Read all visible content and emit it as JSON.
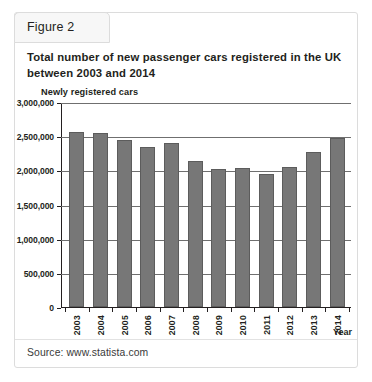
{
  "figure": {
    "tab_label": "Figure 2",
    "title": "Total number of new passenger cars registered in the UK between 2003 and 2014",
    "source": "Source: www.statista.com"
  },
  "chart_data": {
    "type": "bar",
    "title": "Total number of new passenger cars registered in the UK between 2003 and 2014",
    "xlabel": "Year",
    "ylabel": "Newly registered cars",
    "categories": [
      "2003",
      "2004",
      "2005",
      "2006",
      "2007",
      "2008",
      "2009",
      "2010",
      "2011",
      "2012",
      "2013",
      "2014"
    ],
    "values": [
      2560000,
      2550000,
      2440000,
      2340000,
      2400000,
      2130000,
      2020000,
      2030000,
      1940000,
      2045000,
      2265000,
      2475000
    ],
    "ylim": [
      0,
      3000000
    ],
    "ytick_labels": [
      "3,000,000",
      "2,500,000",
      "2,000,000",
      "1,500,000",
      "1,000,000",
      "500,000",
      "0"
    ],
    "ytick_values": [
      3000000,
      2500000,
      2000000,
      1500000,
      1000000,
      500000,
      0
    ],
    "grid": true,
    "legend": "none",
    "bar_color": "#777777",
    "bar_edge_color": "#5c5c5c",
    "axis_color": "#231f20"
  }
}
